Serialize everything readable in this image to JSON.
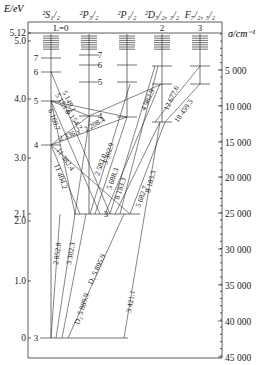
{
  "axes": {
    "left_title": "E/eV",
    "right_title": "σ/cm⁻¹",
    "frame": {
      "left": 28,
      "top": 22,
      "right": 222,
      "bottom": 358
    },
    "left_ticks": [
      {
        "label": "5.12",
        "y": 33
      },
      {
        "label": "5.0",
        "y": 41
      },
      {
        "label": "4.0",
        "y": 99
      },
      {
        "label": "3.0",
        "y": 158
      },
      {
        "label": "2.1",
        "y": 214
      },
      {
        "label": "2.0",
        "y": 221
      },
      {
        "label": "1.0",
        "y": 281
      },
      {
        "label": "0",
        "y": 338
      }
    ],
    "right_ticks": [
      {
        "label": "5 000",
        "y": 70
      },
      {
        "label": "10 000",
        "y": 106
      },
      {
        "label": "15 000",
        "y": 142
      },
      {
        "label": "20 000",
        "y": 177
      },
      {
        "label": "25 000",
        "y": 213
      },
      {
        "label": "30 000",
        "y": 249
      },
      {
        "label": "35 000",
        "y": 285
      },
      {
        "label": "40 000",
        "y": 321
      },
      {
        "label": "45 000",
        "y": 357
      }
    ],
    "ionization_line_y": 33
  },
  "columns": [
    {
      "id": "S",
      "header": "²S₁/₂",
      "sub": "L=0",
      "x": 51
    },
    {
      "id": "P32",
      "header": "²P₃/₂",
      "sub": "",
      "x": 89
    },
    {
      "id": "P12",
      "header": "²P₁/₂",
      "sub": "",
      "x": 127
    },
    {
      "id": "D",
      "header": "²D₅/₂, ₃/₂",
      "sub": "2",
      "x": 162
    },
    {
      "id": "F",
      "header": "F₇/₂, ₅/₂",
      "sub": "3",
      "x": 200
    }
  ],
  "levels": [
    {
      "col": "S",
      "n": "3",
      "y": 338,
      "x1": 40,
      "x2": 128
    },
    {
      "col": "S",
      "n": "4",
      "y": 145
    },
    {
      "col": "S",
      "n": "5",
      "y": 101
    },
    {
      "col": "S",
      "n": "6",
      "y": 72
    },
    {
      "col": "S",
      "n": "7",
      "y": 58
    },
    {
      "col": "P32",
      "n": "3",
      "y": 214,
      "x1": 74,
      "x2": 140
    },
    {
      "col": "P32",
      "n": "4",
      "y": 116
    },
    {
      "col": "P32",
      "n": "5",
      "y": 82
    },
    {
      "col": "P32",
      "n": "6",
      "y": 65
    },
    {
      "col": "P32",
      "n": "7",
      "y": 55
    },
    {
      "col": "P12",
      "n": "4",
      "y": 117
    },
    {
      "col": "P12",
      "n": "5",
      "y": 82
    },
    {
      "col": "P12",
      "n": "6",
      "y": 65
    },
    {
      "col": "D",
      "n": "3",
      "y": 122
    },
    {
      "col": "D",
      "n": "4",
      "y": 84
    },
    {
      "col": "D",
      "n": "5",
      "y": 66
    },
    {
      "col": "F",
      "n": "4",
      "y": 84
    },
    {
      "col": "F",
      "n": "5",
      "y": 66
    }
  ],
  "transitions": [
    {
      "x1": 51,
      "y1": 338,
      "x2": 60,
      "y2": 214,
      "label": "2 852.8"
    },
    {
      "x1": 56,
      "y1": 338,
      "x2": 90,
      "y2": 116,
      "label": "3 302.3"
    },
    {
      "x1": 62,
      "y1": 338,
      "x2": 86,
      "y2": 214,
      "label": "D₂ 5 889.9"
    },
    {
      "x1": 68,
      "y1": 338,
      "x2": 124,
      "y2": 214,
      "label": "D₁ 5 895.9"
    },
    {
      "x1": 124,
      "y1": 338,
      "x2": 160,
      "y2": 122,
      "label": "3 421.1"
    },
    {
      "x1": 51,
      "y1": 72,
      "x2": 110,
      "y2": 214,
      "label": "5 149.1"
    },
    {
      "x1": 51,
      "y1": 101,
      "x2": 100,
      "y2": 214,
      "label": "5 153.6"
    },
    {
      "x1": 51,
      "y1": 101,
      "x2": 89,
      "y2": 116,
      "label": "6 154.2"
    },
    {
      "x1": 51,
      "y1": 101,
      "x2": 75,
      "y2": 214,
      "label": "6 160.7"
    },
    {
      "x1": 51,
      "y1": 145,
      "x2": 89,
      "y2": 116,
      "label": "2 208.4"
    },
    {
      "x1": 51,
      "y1": 145,
      "x2": 127,
      "y2": 117,
      "label": "2 336.x"
    },
    {
      "x1": 51,
      "y1": 145,
      "x2": 80,
      "y2": 214,
      "label": "11 382.4"
    },
    {
      "x1": 51,
      "y1": 145,
      "x2": 130,
      "y2": 214,
      "label": "11 404.2"
    },
    {
      "x1": 90,
      "y1": 214,
      "x2": 130,
      "y2": 84,
      "label": "2 583.0"
    },
    {
      "x1": 95,
      "y1": 214,
      "x2": 127,
      "y2": 117,
      "label": "3 302.9"
    },
    {
      "x1": 110,
      "y1": 214,
      "x2": 155,
      "y2": 66,
      "label": "4 982.9"
    },
    {
      "x1": 105,
      "y1": 214,
      "x2": 160,
      "y2": 84,
      "label": "5 688.3"
    },
    {
      "x1": 115,
      "y1": 214,
      "x2": 160,
      "y2": 122,
      "label": "8 183.3"
    },
    {
      "x1": 120,
      "y1": 214,
      "x2": 158,
      "y2": 66,
      "label": "5 682.7"
    },
    {
      "x1": 130,
      "y1": 214,
      "x2": 165,
      "y2": 122,
      "label": "8 183.3"
    },
    {
      "x1": 155,
      "y1": 122,
      "x2": 200,
      "y2": 66,
      "label": "12 677.6"
    },
    {
      "x1": 165,
      "y1": 122,
      "x2": 200,
      "y2": 84,
      "label": "18 459.5"
    },
    {
      "x1": 89,
      "y1": 116,
      "x2": 162,
      "y2": 84,
      "label": ""
    },
    {
      "x1": 127,
      "y1": 117,
      "x2": 51,
      "y2": 101,
      "label": ""
    }
  ],
  "labels": [
    {
      "text": "5 149.1",
      "x": 62,
      "y": 92,
      "rot": 65
    },
    {
      "text": "5 153.6",
      "x": 55,
      "y": 95,
      "rot": 60
    },
    {
      "text": "6 154.2",
      "x": 66,
      "y": 112,
      "rot": 55
    },
    {
      "text": "6 160.7",
      "x": 48,
      "y": 110,
      "rot": 70
    },
    {
      "text": "2 208.4",
      "x": 86,
      "y": 132,
      "rot": -30
    },
    {
      "text": "2 336.x",
      "x": 60,
      "y": 141,
      "rot": -20
    },
    {
      "text": "11 382.4",
      "x": 56,
      "y": 150,
      "rot": 55
    },
    {
      "text": "11 404.2",
      "x": 54,
      "y": 165,
      "rot": 70
    },
    {
      "text": "2 583.0",
      "x": 99,
      "y": 176,
      "rot": -70
    },
    {
      "text": "3 302.9",
      "x": 107,
      "y": 165,
      "rot": -72
    },
    {
      "text": "4 982.9",
      "x": 145,
      "y": 111,
      "rot": -65
    },
    {
      "text": "5 688.3",
      "x": 111,
      "y": 190,
      "rot": -70
    },
    {
      "text": "8 183.3",
      "x": 119,
      "y": 200,
      "rot": -72
    },
    {
      "text": "5 682.7",
      "x": 140,
      "y": 208,
      "rot": -70
    },
    {
      "text": "8 183.3",
      "x": 150,
      "y": 193,
      "rot": -75
    },
    {
      "text": "12 677.6",
      "x": 168,
      "y": 111,
      "rot": -65
    },
    {
      "text": "18 459.5",
      "x": 178,
      "y": 123,
      "rot": -55
    },
    {
      "text": "2 852.8",
      "x": 58,
      "y": 265,
      "rot": -82
    },
    {
      "text": "3 302.3",
      "x": 71,
      "y": 265,
      "rot": -80
    },
    {
      "text": "D₁ 5 895.9",
      "x": 92,
      "y": 285,
      "rot": -65
    },
    {
      "text": "D₂ 5 889.9",
      "x": 79,
      "y": 325,
      "rot": -72
    },
    {
      "text": "3 421.1",
      "x": 131,
      "y": 313,
      "rot": -80
    }
  ],
  "level_numbers": [
    {
      "text": "7",
      "x": 36,
      "y": 61
    },
    {
      "text": "6",
      "x": 36,
      "y": 75
    },
    {
      "text": "5",
      "x": 36,
      "y": 104
    },
    {
      "text": "4",
      "x": 36,
      "y": 148
    },
    {
      "text": "3",
      "x": 36,
      "y": 341
    },
    {
      "text": "7",
      "x": 100,
      "y": 58
    },
    {
      "text": "6",
      "x": 100,
      "y": 68
    },
    {
      "text": "5",
      "x": 100,
      "y": 85
    },
    {
      "text": "4",
      "x": 100,
      "y": 119
    },
    {
      "text": "3",
      "x": 106,
      "y": 217
    }
  ]
}
